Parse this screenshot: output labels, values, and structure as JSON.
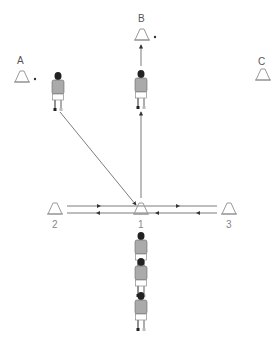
{
  "diagram": {
    "type": "drill",
    "cones": [
      {
        "id": "A",
        "label": "A",
        "x": 22,
        "y": 77
      },
      {
        "id": "B",
        "label": "B",
        "x": 142,
        "y": 35
      },
      {
        "id": "C",
        "label": "C",
        "x": 263,
        "y": 75
      },
      {
        "id": "1",
        "label": "1",
        "x": 141,
        "y": 213
      },
      {
        "id": "2",
        "label": "2",
        "x": 55,
        "y": 213
      },
      {
        "id": "3",
        "label": "3",
        "x": 229,
        "y": 213
      }
    ],
    "players": [
      {
        "id": "player-at-A",
        "x": 58,
        "y": 90
      },
      {
        "id": "player-at-B",
        "x": 141,
        "y": 86
      },
      {
        "id": "queue-player-1",
        "x": 141,
        "y": 256
      },
      {
        "id": "queue-player-2",
        "x": 141,
        "y": 280
      },
      {
        "id": "queue-player-3",
        "x": 141,
        "y": 313
      }
    ],
    "passes": [
      {
        "from": "player-at-A",
        "to": "cone-1",
        "style": "arrow"
      },
      {
        "from": "cone-1",
        "to": "player-at-B",
        "style": "arrow"
      },
      {
        "from": "cone-2",
        "to": "cone-3",
        "style": "line-right",
        "y": 206
      },
      {
        "from": "cone-3",
        "to": "cone-2",
        "style": "line-left",
        "y": 213
      }
    ],
    "colors": {
      "line": "#555555",
      "cone": "#aaaaaa",
      "label": "#555555",
      "number": "#888888",
      "shirt": "#999999",
      "hair": "#222222"
    }
  }
}
